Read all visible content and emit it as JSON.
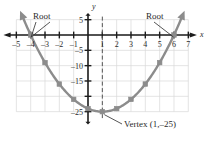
{
  "figure": {
    "type": "coordinate-plane-parabola",
    "axis_labels": {
      "x": "x",
      "y": "y"
    },
    "colors": {
      "curve": "#8c8c8c",
      "axis": "#1c1c1c",
      "grid": "#d8d8d8",
      "text": "#2b2b2b",
      "dashed": "#555555"
    }
  },
  "annotations": {
    "root_left": "Root",
    "root_right": "Root",
    "vertex": "Vertex (1,–25)"
  },
  "x_axis": {
    "label": "x",
    "min": -5.6,
    "max": 7.4,
    "ticks": [
      -5,
      -4,
      -3,
      -2,
      -1,
      1,
      2,
      3,
      4,
      5,
      6,
      7
    ],
    "tick_labels": [
      "–5",
      "–4",
      "–3",
      "–2",
      "–1",
      "1",
      "2",
      "3",
      "4",
      "5",
      "6",
      "7"
    ]
  },
  "y_axis": {
    "label": "y",
    "min": -29,
    "max": 7,
    "ticks": [
      5,
      -5,
      -10,
      -15,
      -20,
      -25
    ],
    "tick_labels": [
      "5",
      "–5",
      "–10",
      "–15",
      "",
      "–25"
    ]
  },
  "chart_data": {
    "type": "line",
    "title": "",
    "xlabel": "x",
    "ylabel": "y",
    "xlim": [
      -5.6,
      7.4
    ],
    "ylim": [
      -29,
      7
    ],
    "grid": true,
    "legend": "none",
    "equation": "y = (x + 4)(x – 6) = x² – 2x – 24",
    "roots": [
      -4,
      6
    ],
    "vertex": [
      1,
      -25
    ],
    "axis_of_symmetry": 1,
    "series": [
      {
        "name": "parabola",
        "marker": "square",
        "x": [
          -4,
          -3,
          -2,
          -1,
          0,
          1,
          2,
          3,
          4,
          5,
          6
        ],
        "values": [
          0,
          -9,
          -16,
          -21,
          -24,
          -25,
          -24,
          -21,
          -16,
          -9,
          0
        ]
      }
    ]
  }
}
